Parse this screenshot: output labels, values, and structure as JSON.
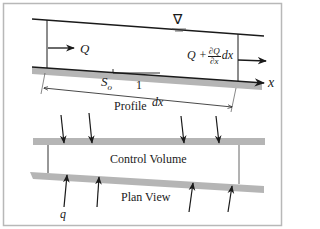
{
  "figure": {
    "colors": {
      "border": "#b8b8b8",
      "line": "#1a1a1a",
      "band": "#b5b5b5"
    },
    "profile": {
      "title": "Profile",
      "water_surface_symbol": "∇",
      "inflow_label": "Q",
      "outflow_label": {
        "base": "Q +",
        "frac_num": "∂Q",
        "frac_den": "∂x",
        "suffix": "dx"
      },
      "slope_label": "S",
      "slope_subscript": "o",
      "slope_run_label": "1",
      "length_label": "dx",
      "axis_label": "x"
    },
    "plan": {
      "title": "Plan View",
      "volume_label": "Control Volume",
      "lateral_inflow_label": "q"
    }
  }
}
